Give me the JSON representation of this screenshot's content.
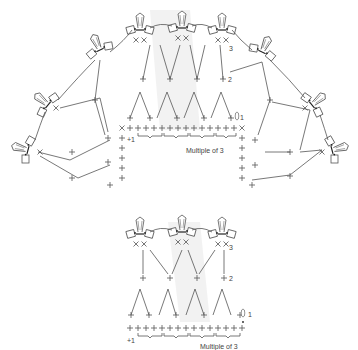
{
  "diagrams": {
    "fan": {
      "row_labels": [
        "1",
        "2",
        "3"
      ],
      "start_label": "+1",
      "repeat_label": "Multiple of 3"
    },
    "straight": {
      "row_labels": [
        "1",
        "2",
        "3"
      ],
      "start_label": "+1",
      "repeat_label": "Multiple of 3"
    }
  },
  "symbols": [
    "single-crochet",
    "double-crochet",
    "chain",
    "slip-stitch",
    "petal-cluster"
  ]
}
